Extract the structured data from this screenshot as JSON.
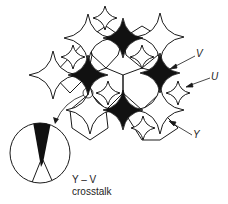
{
  "diagram": {
    "type": "pixel-mosaic-illustration",
    "labels": {
      "v": "V",
      "u": "U",
      "y": "Y"
    },
    "inset": {
      "caption_line1": "Y – V",
      "caption_line2": "crosstalk"
    },
    "colors": {
      "stroke": "#1a1a1a",
      "fill_dark": "#111111",
      "fill_light": "#ffffff"
    },
    "stars": {
      "large_white": [
        [
          88,
          38
        ],
        [
          160,
          37
        ],
        [
          53,
          75
        ],
        [
          90,
          110
        ],
        [
          160,
          110
        ]
      ],
      "black": [
        [
          123,
          38
        ],
        [
          88,
          75
        ],
        [
          160,
          73
        ],
        [
          123,
          110
        ]
      ],
      "small_white": [
        [
          105,
          18
        ],
        [
          73,
          57
        ],
        [
          142,
          57
        ],
        [
          108,
          93
        ],
        [
          178,
          93
        ],
        [
          143,
          128
        ]
      ]
    },
    "hexagons": [
      [
        105,
        57
      ],
      [
        142,
        92
      ],
      [
        122,
        74
      ]
    ],
    "lens": {
      "cx": 40,
      "cy": 150,
      "r": 30
    }
  }
}
